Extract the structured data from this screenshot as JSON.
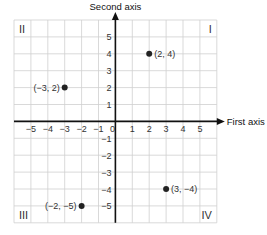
{
  "chart_data": {
    "type": "scatter",
    "title": "",
    "xlabel": "First axis",
    "ylabel": "Second axis",
    "xlim": [
      -6,
      6
    ],
    "ylim": [
      -6,
      6
    ],
    "grid": true,
    "xticks": [
      -5,
      -4,
      -3,
      -2,
      -1,
      0,
      1,
      2,
      3,
      4,
      5
    ],
    "yticks": [
      5,
      4,
      3,
      2,
      1,
      -1,
      -2,
      -3,
      -4,
      -5
    ],
    "points": [
      {
        "x": 2,
        "y": 4,
        "label": "(2, 4)"
      },
      {
        "x": -3,
        "y": 2,
        "label": "(−3, 2)"
      },
      {
        "x": 3,
        "y": -4,
        "label": "(3, −4)"
      },
      {
        "x": -2,
        "y": -5,
        "label": "(−2, −5)"
      }
    ],
    "quadrants": [
      {
        "name": "I",
        "position": "top-right"
      },
      {
        "name": "II",
        "position": "top-left"
      },
      {
        "name": "III",
        "position": "bottom-left"
      },
      {
        "name": "IV",
        "position": "bottom-right"
      }
    ],
    "colors": {
      "point": "#222222",
      "axis": "#111111",
      "grid": "#cfcfcf"
    }
  }
}
